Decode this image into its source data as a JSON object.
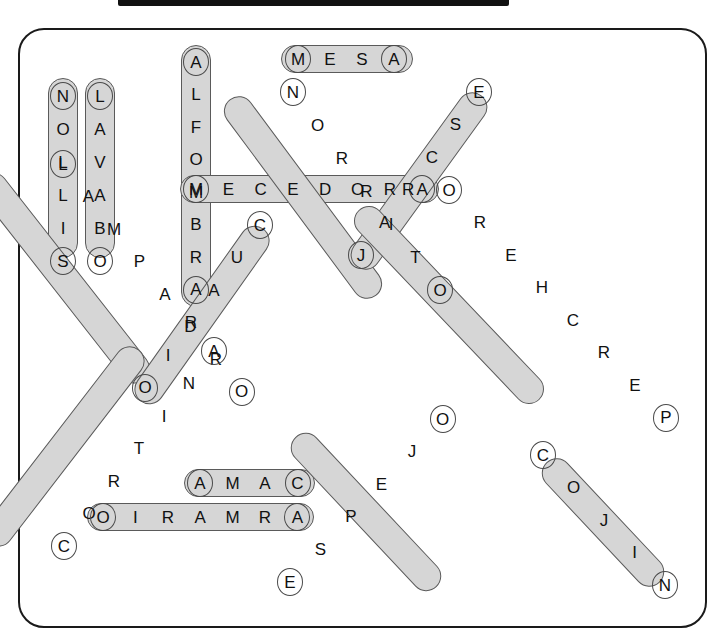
{
  "window": {
    "chrome_bar": "titlebar-strip"
  },
  "puzzle": {
    "title": "",
    "type": "word-search",
    "board": {
      "width": 685,
      "height": 596,
      "border_color": "#1a1a1a",
      "background": "#ffffff",
      "highlight_fill": "#d6d6d6",
      "highlight_stroke": "#5a5a5a"
    },
    "words": [
      {
        "id": "nollis",
        "text": "NOLLIS",
        "solution": "SILLON",
        "direction": "vertical-down",
        "letters": [
          "N",
          "O",
          "L",
          "L",
          "I",
          "S"
        ],
        "x": 63,
        "y": 96,
        "step_x": 0,
        "step_y": 33,
        "pill": {
          "left": 48,
          "top": 78,
          "width": 30,
          "height": 180,
          "angle": 0
        }
      },
      {
        "id": "lavabo",
        "text": "LAVABO",
        "solution": "LAVABO",
        "direction": "vertical-down",
        "letters": [
          "L",
          "A",
          "V",
          "A",
          "B",
          "O"
        ],
        "x": 100,
        "y": 96,
        "step_x": 0,
        "step_y": 33,
        "pill": {
          "left": 85,
          "top": 78,
          "width": 30,
          "height": 180,
          "angle": 0
        }
      },
      {
        "id": "alfombra",
        "text": "ALFOMBRA",
        "solution": "ALFOMBRA",
        "direction": "vertical-down",
        "letters": [
          "A",
          "L",
          "F",
          "O",
          "M",
          "B",
          "R",
          "A"
        ],
        "x": 196,
        "y": 62,
        "step_x": 0,
        "step_y": 32.5,
        "pill": {
          "left": 181,
          "top": 45,
          "width": 30,
          "height": 262,
          "angle": 0
        }
      },
      {
        "id": "mesa",
        "text": "MESA",
        "solution": "MESA",
        "direction": "horizontal-right",
        "letters": [
          "M",
          "E",
          "S",
          "A"
        ],
        "x": 298,
        "y": 59,
        "step_x": 32,
        "step_y": 0,
        "pill": {
          "left": 281,
          "top": 45,
          "width": 132,
          "height": 28,
          "angle": 0
        }
      },
      {
        "id": "mecedora",
        "text": "MECEDORA",
        "solution": "MECEDORA",
        "direction": "horizontal-right",
        "letters": [
          "M",
          "E",
          "C",
          "E",
          "D",
          "O",
          "R",
          "A"
        ],
        "x": 196,
        "y": 189,
        "step_x": 32.3,
        "step_y": 0,
        "pill": {
          "left": 180,
          "top": 175,
          "width": 259,
          "height": 28,
          "angle": 0
        }
      },
      {
        "id": "otirron",
        "text": "NORRITO",
        "solution": "NORRITO",
        "direction": "diagonal-down-right",
        "letters": [
          "N",
          "O",
          "R",
          "R",
          "I",
          "T",
          "O"
        ],
        "x": 293,
        "y": 92,
        "step_x": 24.5,
        "step_y": 33,
        "pill": {
          "left": 288,
          "top": 75,
          "width": 30,
          "height": 245,
          "angle": -36.6
        }
      },
      {
        "id": "escraj",
        "text": "ESCRAJ",
        "solution": "ESCRAJ",
        "direction": "diagonal-down-left",
        "letters": [
          "E",
          "S",
          "C",
          "R",
          "A",
          "J"
        ],
        "x": 479,
        "y": 92,
        "step_x": -23.6,
        "step_y": 32.6,
        "pill": {
          "left": 404,
          "top": 75,
          "width": 30,
          "height": 212,
          "angle": 35.9
        }
      },
      {
        "id": "lampadro",
        "text": "LAMPADRO",
        "solution": "LAMPADRO",
        "direction": "diagonal-down-right",
        "letters": [
          "L",
          "A",
          "M",
          "P",
          "A",
          "D",
          "R",
          "O"
        ],
        "x": 63,
        "y": 164,
        "step_x": 25.5,
        "step_y": 32.5,
        "pill": {
          "left": 49,
          "top": 148,
          "width": 30,
          "height": 260,
          "angle": -38.1
        }
      },
      {
        "id": "cuario",
        "text": "CUARIO",
        "solution": "CUARIO",
        "direction": "diagonal-down-left",
        "letters": [
          "C",
          "U",
          "A",
          "R",
          "I",
          "O"
        ],
        "x": 260,
        "y": 225,
        "step_x": -23,
        "step_y": 32.5,
        "pill": {
          "left": 187,
          "top": 209,
          "width": 30,
          "height": 212,
          "angle": 35.3
        }
      },
      {
        "id": "orehcrep",
        "text": "OREHCREP",
        "solution": "PERCHERO",
        "direction": "diagonal-down-right",
        "letters": [
          "O",
          "R",
          "E",
          "H",
          "C",
          "R",
          "E",
          "P"
        ],
        "x": 449,
        "y": 190,
        "step_x": 31,
        "step_y": 32.5,
        "pill": {
          "left": 434,
          "top": 174,
          "width": 30,
          "height": 262,
          "angle": -43.6
        }
      },
      {
        "id": "cortina",
        "text": "CORTINA",
        "solution": "CORTINA",
        "direction": "diagonal-down-right",
        "letters": [
          "C",
          "O",
          "R",
          "T",
          "I",
          "N",
          "A"
        ],
        "x": 64,
        "y": 546,
        "step_x": 25,
        "step_y": -32.5,
        "pill": {
          "left": 49,
          "top": 324,
          "width": 30,
          "height": 245,
          "angle": 37.6
        }
      },
      {
        "id": "amac",
        "text": "AMAC",
        "solution": "CAMA",
        "direction": "horizontal-right",
        "letters": [
          "A",
          "M",
          "A",
          "C"
        ],
        "x": 200,
        "y": 483,
        "step_x": 32.5,
        "step_y": 0,
        "pill": {
          "left": 184,
          "top": 469,
          "width": 131,
          "height": 28,
          "angle": 0
        }
      },
      {
        "id": "oiramra",
        "text": "OIRAMRA",
        "solution": "ARMARIO",
        "direction": "horizontal-right",
        "letters": [
          "O",
          "I",
          "R",
          "A",
          "M",
          "R",
          "A"
        ],
        "x": 103,
        "y": 517,
        "step_x": 32.4,
        "step_y": 0,
        "pill": {
          "left": 87,
          "top": 503,
          "width": 227,
          "height": 28,
          "angle": 0
        }
      },
      {
        "id": "espejo",
        "text": "ESPEJO",
        "solution": "ESPEJO",
        "direction": "diagonal-up-right",
        "letters": [
          "E",
          "S",
          "P",
          "E",
          "J",
          "O"
        ],
        "x": 290,
        "y": 582,
        "step_x": 30.5,
        "step_y": -32.6,
        "pill": {
          "left": 351,
          "top": 409,
          "width": 30,
          "height": 206,
          "angle": -43.2
        }
      },
      {
        "id": "cojin",
        "text": "COJIN",
        "solution": "COJIN",
        "direction": "diagonal-down-right",
        "letters": [
          "C",
          "O",
          "J",
          "I",
          "N"
        ],
        "x": 543,
        "y": 455,
        "step_x": 30.5,
        "step_y": 32.5,
        "pill": {
          "left": 588,
          "top": 440,
          "width": 30,
          "height": 165,
          "angle": -43.2
        }
      }
    ]
  }
}
